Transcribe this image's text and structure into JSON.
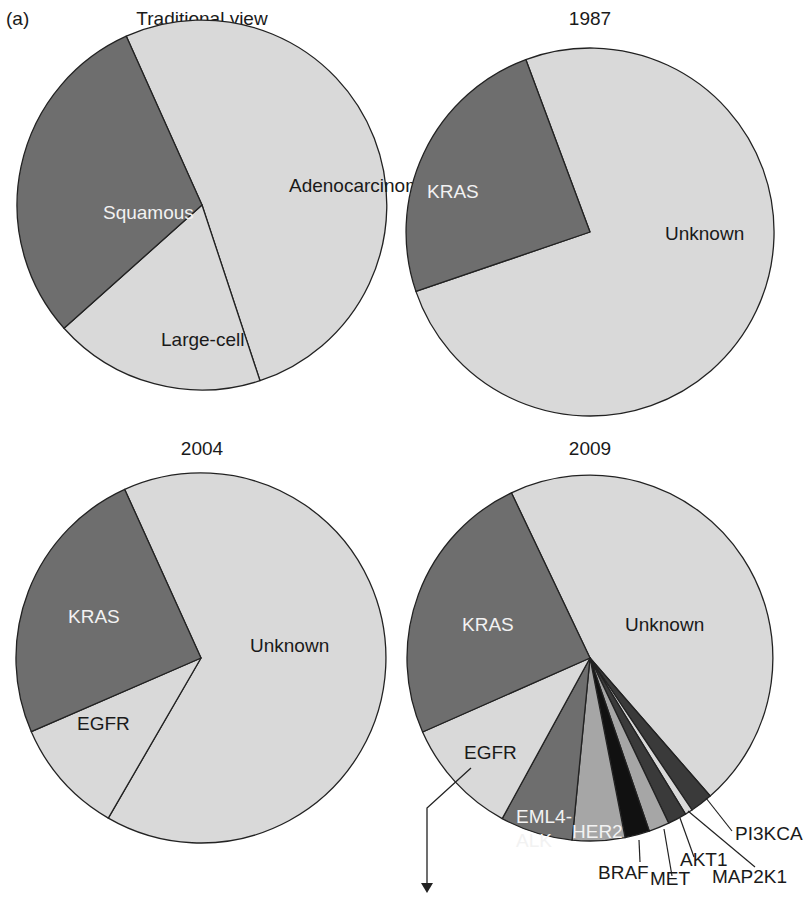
{
  "panel_label": "(a)",
  "colors": {
    "light": "#d9d9d9",
    "dark": "#6e6e6e",
    "medium": "#a6a6a6",
    "darker": "#3a3a3a",
    "black": "#111111",
    "edge": "#222222"
  },
  "chart_data": [
    {
      "type": "pie",
      "title": "Traditional view",
      "center": [
        202,
        205
      ],
      "r": 185,
      "slices": [
        {
          "label": "Adenocarcinoma",
          "value": 50,
          "fill": "light",
          "text": "dark"
        },
        {
          "label": "Large-cell",
          "value": 22,
          "fill": "light",
          "text": "dark"
        },
        {
          "label": "Squamous",
          "value": 28,
          "fill": "dark",
          "text": "white"
        }
      ],
      "boundary_points": [
        [
          137,
          60
        ],
        [
          268,
          405
        ],
        [
          53,
          338
        ]
      ],
      "labels_pos": [
        [
          289,
          192
        ],
        [
          161,
          346
        ],
        [
          103,
          219
        ]
      ]
    },
    {
      "type": "pie",
      "title": "1987",
      "center": [
        590,
        232
      ],
      "r": 184,
      "slices": [
        {
          "label": "Unknown",
          "value": 75,
          "fill": "light",
          "text": "dark"
        },
        {
          "label": "KRAS",
          "value": 25,
          "fill": "dark",
          "text": "white"
        }
      ],
      "boundary_points": [
        [
          526,
          60
        ],
        [
          420,
          290
        ]
      ],
      "labels_pos": [
        [
          665,
          240
        ],
        [
          427,
          198
        ]
      ]
    },
    {
      "type": "pie",
      "title": "2004",
      "center": [
        201,
        658
      ],
      "r": 185,
      "slices": [
        {
          "label": "Unknown",
          "value": 63,
          "fill": "light",
          "text": "dark"
        },
        {
          "label": "EGFR",
          "value": 11,
          "fill": "light",
          "text": "dark"
        },
        {
          "label": "KRAS",
          "value": 26,
          "fill": "dark",
          "text": "white"
        }
      ],
      "boundary_points": [
        [
          125,
          490
        ],
        [
          106,
          822
        ],
        [
          33,
          731
        ]
      ],
      "labels_pos": [
        [
          250,
          652
        ],
        [
          77,
          730
        ],
        [
          68,
          623
        ]
      ]
    },
    {
      "type": "pie",
      "title": "2009",
      "center": [
        590,
        658
      ],
      "r": 183,
      "slices": [
        {
          "label": "Unknown",
          "value": 39,
          "fill": "light",
          "text": "dark"
        },
        {
          "label": "PI3KCA",
          "value": 2,
          "fill": "darker",
          "text": "dark"
        },
        {
          "label": "MAP2K1",
          "value": 0.5,
          "fill": "light",
          "text": "dark"
        },
        {
          "label": "AKT1",
          "value": 1,
          "fill": "darker",
          "text": "dark"
        },
        {
          "label": "MET",
          "value": 1.5,
          "fill": "medium",
          "text": "dark"
        },
        {
          "label": "BRAF",
          "value": 2,
          "fill": "black",
          "text": "dark"
        },
        {
          "label": "HER2",
          "value": 5,
          "fill": "medium",
          "text": "white"
        },
        {
          "label": "EML4-ALK",
          "value": 6,
          "fill": "dark",
          "text": "white"
        },
        {
          "label": "EGFR",
          "value": 13,
          "fill": "light",
          "text": "dark"
        },
        {
          "label": "KRAS",
          "value": 25,
          "fill": "dark",
          "text": "white"
        }
      ],
      "boundary_points": [
        [
          511,
          492
        ],
        [
          711,
          797
        ],
        [
          692,
          810
        ],
        [
          686,
          815
        ],
        [
          670,
          826
        ],
        [
          651,
          836
        ],
        [
          626,
          842
        ],
        [
          572,
          841
        ],
        [
          502,
          819
        ],
        [
          425,
          731
        ]
      ],
      "labels_pos": [
        [
          625,
          631
        ],
        [
          735,
          840
        ],
        [
          712,
          883
        ],
        [
          680,
          866
        ],
        [
          650,
          885
        ],
        [
          598,
          879
        ],
        [
          572,
          838
        ],
        [
          516,
          823
        ],
        [
          464,
          759
        ],
        [
          462,
          631
        ]
      ],
      "label_lines": [
        {
          "from": [
            706,
            798
          ],
          "to": [
            732,
            831
          ]
        },
        {
          "from": [
            688,
            811
          ],
          "to": [
            755,
            867
          ]
        },
        {
          "from": [
            680,
            818
          ],
          "to": [
            694,
            857
          ]
        },
        {
          "from": [
            664,
            829
          ],
          "to": [
            672,
            876
          ]
        },
        {
          "from": [
            639,
            840
          ],
          "to": [
            640,
            862
          ]
        }
      ],
      "arrow": {
        "from": [
          471,
          768
        ],
        "elbow": [
          427,
          808
        ],
        "to": [
          427,
          893
        ]
      },
      "multiline": {
        "EML4-ALK": [
          "EML4-",
          "ALK"
        ]
      }
    }
  ]
}
